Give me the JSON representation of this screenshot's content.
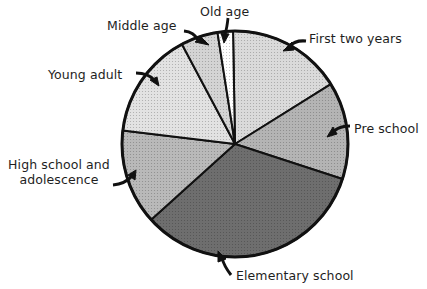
{
  "chart_data": {
    "type": "pie",
    "title": "",
    "start_angle_deg": 0,
    "direction": "clockwise",
    "categories": [
      "First two years",
      "Pre school",
      "Elementary school",
      "High school and adolescence",
      "Young adult",
      "Middle age",
      "Old age"
    ],
    "values": [
      16.4,
      13.9,
      33.3,
      13.6,
      15.3,
      5.3,
      2.2
    ],
    "unit": "percent (estimated from slice angles)",
    "fills": [
      "#dadada",
      "#b4b4b4",
      "#6e6e6e",
      "#b9b9b9",
      "#e2e2e2",
      "#d4d4d4",
      "#ffffff"
    ],
    "legend": "none (labels with arrows)"
  },
  "labels": {
    "first_two_years": "First two years",
    "pre_school": "Pre school",
    "elementary": "Elementary school",
    "high_school_line1": "High school and",
    "high_school_line2": "adolescence",
    "young_adult": "Young adult",
    "middle_age": "Middle age",
    "old_age": "Old age"
  }
}
